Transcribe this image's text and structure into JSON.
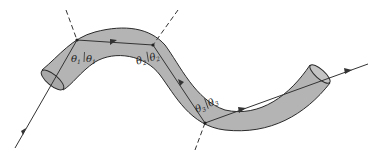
{
  "diagram": {
    "colors": {
      "tube_fill": "#b4b4b4",
      "tube_edge": "#2a2a2a",
      "ray": "#333333",
      "normal": "#333333",
      "background": "#ffffff"
    },
    "reflections": [
      {
        "label_left": "θ",
        "label_right": "θ",
        "subscript": "1"
      },
      {
        "label_left": "θ",
        "label_right": "θ",
        "subscript": "2"
      },
      {
        "label_left": "θ",
        "label_right": "θ",
        "subscript": "3"
      }
    ]
  }
}
